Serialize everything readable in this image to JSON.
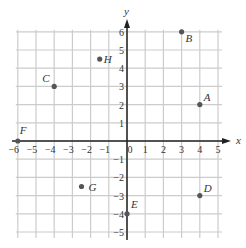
{
  "chart_data": {
    "type": "scatter",
    "title": "",
    "xlabel": "x",
    "ylabel": "y",
    "xlim": [
      -6,
      5
    ],
    "ylim": [
      -5,
      6
    ],
    "grid": true,
    "x_ticks": [
      -6,
      -5,
      -4,
      -3,
      -2,
      -1,
      0,
      1,
      2,
      3,
      4,
      5
    ],
    "y_ticks": [
      6,
      5,
      4,
      3,
      2,
      1,
      -1,
      -2,
      -3,
      -4,
      -5
    ],
    "points": [
      {
        "label": "A",
        "x": 4,
        "y": 2
      },
      {
        "label": "B",
        "x": 3,
        "y": 6
      },
      {
        "label": "C",
        "x": -4,
        "y": 3
      },
      {
        "label": "D",
        "x": 4,
        "y": -3
      },
      {
        "label": "E",
        "x": 0,
        "y": -4
      },
      {
        "label": "F",
        "x": -6,
        "y": 0
      },
      {
        "label": "G",
        "x": -2.5,
        "y": -2.5
      },
      {
        "label": "H",
        "x": -1.5,
        "y": 4.5
      }
    ]
  },
  "colors": {
    "grid": "#cccccc",
    "axis": "#222222",
    "point": "#555555",
    "text": "#333333"
  }
}
